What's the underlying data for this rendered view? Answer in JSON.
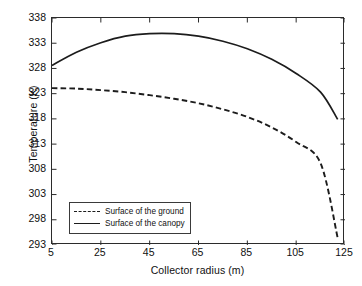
{
  "chart_data": {
    "type": "line",
    "title": "",
    "xlabel": "Collector radius (m)",
    "ylabel": "Temperature (K)",
    "xlim": [
      5,
      125
    ],
    "ylim": [
      293,
      338
    ],
    "xticks": [
      5,
      25,
      45,
      65,
      85,
      105,
      125
    ],
    "yticks": [
      293,
      298,
      303,
      308,
      313,
      318,
      323,
      328,
      333,
      338
    ],
    "grid": false,
    "legend_position": "lower-left-inside",
    "series": [
      {
        "name": "Surface of the ground",
        "style": "dashed",
        "color": "#1c1c1c",
        "x": [
          5,
          15,
          25,
          35,
          45,
          55,
          65,
          75,
          85,
          95,
          105,
          115,
          122
        ],
        "values": [
          324.1,
          324.0,
          323.7,
          323.3,
          322.7,
          322.0,
          321.1,
          319.9,
          318.4,
          316.3,
          313.4,
          309.2,
          294.4
        ]
      },
      {
        "name": "Surface of the canopy",
        "style": "solid",
        "color": "#1c1c1c",
        "x": [
          5,
          15,
          25,
          35,
          45,
          55,
          65,
          75,
          85,
          95,
          105,
          115,
          122
        ],
        "values": [
          328.6,
          331.2,
          333.1,
          334.4,
          334.9,
          334.9,
          334.4,
          333.4,
          331.9,
          329.8,
          327.0,
          323.3,
          317.9
        ]
      }
    ]
  },
  "legend": {
    "items": [
      {
        "label": "Surface of the ground",
        "style": "dashed"
      },
      {
        "label": "Surface of the canopy",
        "style": "solid"
      }
    ]
  }
}
